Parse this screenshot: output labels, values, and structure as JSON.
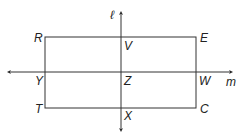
{
  "diagram": {
    "lines": {
      "vertical": {
        "label": "ℓ"
      },
      "horizontal": {
        "label": "m"
      }
    },
    "points": {
      "R": "R",
      "E": "E",
      "C": "C",
      "T": "T",
      "V": "V",
      "W": "W",
      "X": "X",
      "Y": "Y",
      "Z": "Z"
    },
    "colors": {
      "stroke": "#333333",
      "background": "#ffffff"
    }
  }
}
